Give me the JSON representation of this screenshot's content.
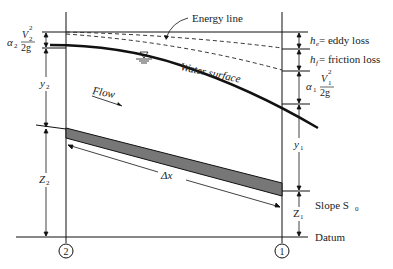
{
  "diagram": {
    "labels": {
      "energy_line": "Energy line",
      "water_surface": "Water surface",
      "flow": "Flow",
      "velocity_head_2_alpha": "α",
      "velocity_head_2_sub": "2",
      "velocity_head_2_num": "V",
      "velocity_head_2_den": "2g",
      "velocity_head_1_alpha": "α",
      "velocity_head_1_sub": "1",
      "velocity_head_1_num": "V",
      "velocity_head_1_den": "2g",
      "he": "h",
      "he_sub": "e",
      "he_text": " = eddy loss",
      "hf": "h",
      "hf_sub": "f",
      "hf_text": " = friction loss",
      "y2": "y",
      "y2_sub": "2",
      "y1": "y",
      "y1_sub": "1",
      "z2": "Z",
      "z2_sub": "2",
      "z1": "Z",
      "z1_sub": "1",
      "dx": "Δx",
      "slope": "Slope S",
      "slope_sub": "0",
      "datum": "Datum",
      "section_2": "2",
      "section_1": "1"
    },
    "colors": {
      "line": "#111111",
      "channel_bed": "#777777",
      "text": "#222222"
    }
  }
}
